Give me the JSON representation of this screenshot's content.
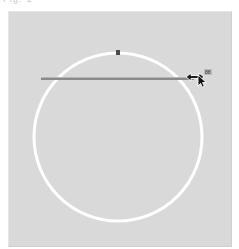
{
  "page": {
    "width": 239,
    "height": 249,
    "background_color": "#ffffff"
  },
  "top_text": {
    "clipped_fragment": "Fig. 1"
  },
  "canvas": {
    "name": "drawing-canvas",
    "background_color": "#d9d9d9",
    "border_light": "#e6e6e6",
    "border_dark": "#cfcfcf",
    "x": 8,
    "y": 11,
    "width": 224,
    "height": 236
  },
  "shapes": {
    "circle": {
      "label": "circle-outline",
      "stroke_color": "#ffffff",
      "stroke_width": 3,
      "center_x": 109,
      "center_y": 125,
      "radius": 84,
      "fill": "none"
    },
    "top_handle": {
      "label": "circle-top-handle",
      "color": "#4a4a4a",
      "x": 109,
      "y": 30,
      "size": 4
    },
    "radius_line": {
      "label": "radius-drag-line",
      "stroke_color": "#8a8a8a",
      "stroke_width": 2,
      "x1": 32,
      "y1": 67,
      "x2": 185,
      "y2": 67
    }
  },
  "cursor": {
    "resize_icon": "horizontal-resize-cursor",
    "resize_color": "#1c1c1c",
    "pointer_icon": "arrow-pointer-cursor",
    "pointer_color": "#111111",
    "x": 183,
    "y": 64
  },
  "tooltip": {
    "label": "radius-value-tooltip",
    "value": "88",
    "text_color": "#2b2b2b",
    "background_color": "#bdbdbd"
  }
}
